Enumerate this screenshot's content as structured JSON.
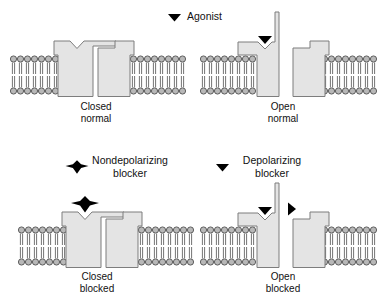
{
  "figure": {
    "legends": {
      "agonist": {
        "label": "Agonist",
        "icon": "down-triangle-icon"
      },
      "nondepolarizing": {
        "line1": "Nondepolarizing",
        "line2": "blocker",
        "icon": "bowtie-blocker-icon"
      },
      "depolarizing": {
        "line1": "Depolarizing",
        "line2": "blocker",
        "icon": "down-triangle-icon"
      }
    },
    "panels": [
      {
        "id": "closed-normal",
        "state": "closed",
        "ligand": "none",
        "caption_line1": "Closed",
        "caption_line2": "normal"
      },
      {
        "id": "open-normal",
        "state": "open",
        "ligand": "agonist",
        "caption_line1": "Open",
        "caption_line2": "normal"
      },
      {
        "id": "closed-blocked",
        "state": "closed",
        "ligand": "nondepolarizing-blocker",
        "caption_line1": "Closed",
        "caption_line2": "blocked"
      },
      {
        "id": "open-blocked",
        "state": "open",
        "ligand": "depolarizing-blocker",
        "caption_line1": "Open",
        "caption_line2": "blocked"
      }
    ],
    "colors": {
      "background": "#ffffff",
      "membrane_head": "#b8b8b8",
      "membrane_outline": "#4f4f4f",
      "protein_fill": "#e4e4e4",
      "protein_outline": "#7d7d7d",
      "ligand": "#000000",
      "text": "#111111"
    }
  }
}
